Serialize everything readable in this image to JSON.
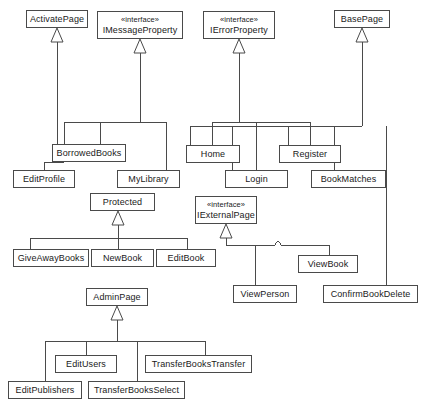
{
  "diagram": {
    "kind": "uml-class-diagram",
    "title": "",
    "background": "#ffffff",
    "line_color": "#4a4a4a",
    "text_color": "#1a1a1a",
    "width": 425,
    "height": 413
  },
  "nodes": [
    {
      "id": "ActivatePage",
      "name": "ActivatePage",
      "stereotype": "",
      "x": 26,
      "y": 10,
      "w": 62,
      "h": 18
    },
    {
      "id": "IMessageProperty",
      "name": "IMessageProperty",
      "stereotype": "«interface»",
      "x": 97,
      "y": 11,
      "w": 86,
      "h": 28
    },
    {
      "id": "IErrorProperty",
      "name": "IErrorProperty",
      "stereotype": "«interface»",
      "x": 203,
      "y": 11,
      "w": 72,
      "h": 28
    },
    {
      "id": "BasePage",
      "name": "BasePage",
      "stereotype": "",
      "x": 334,
      "y": 10,
      "w": 56,
      "h": 18
    },
    {
      "id": "BorrowedBooks",
      "name": "BorrowedBooks",
      "stereotype": "",
      "x": 52,
      "y": 144,
      "w": 74,
      "h": 18
    },
    {
      "id": "Home",
      "name": "Home",
      "stereotype": "",
      "x": 186,
      "y": 145,
      "w": 54,
      "h": 18
    },
    {
      "id": "Register",
      "name": "Register",
      "stereotype": "",
      "x": 279,
      "y": 145,
      "w": 62,
      "h": 18
    },
    {
      "id": "EditProfile",
      "name": "EditProfile",
      "stereotype": "",
      "x": 13,
      "y": 170,
      "w": 62,
      "h": 18
    },
    {
      "id": "MyLibrary",
      "name": "MyLibrary",
      "stereotype": "",
      "x": 117,
      "y": 170,
      "w": 63,
      "h": 18
    },
    {
      "id": "Login",
      "name": "Login",
      "stereotype": "",
      "x": 225,
      "y": 170,
      "w": 63,
      "h": 18
    },
    {
      "id": "BookMatches",
      "name": "BookMatches",
      "stereotype": "",
      "x": 311,
      "y": 170,
      "w": 75,
      "h": 18
    },
    {
      "id": "Protected",
      "name": "Protected",
      "stereotype": "",
      "x": 90,
      "y": 193,
      "w": 65,
      "h": 18
    },
    {
      "id": "IExternalPage",
      "name": "IExternalPage",
      "stereotype": "«interface»",
      "x": 195,
      "y": 196,
      "w": 62,
      "h": 28
    },
    {
      "id": "GiveAwayBooks",
      "name": "GiveAwayBooks",
      "stereotype": "",
      "x": 13,
      "y": 249,
      "w": 76,
      "h": 18
    },
    {
      "id": "NewBook",
      "name": "NewBook",
      "stereotype": "",
      "x": 91,
      "y": 249,
      "w": 63,
      "h": 18
    },
    {
      "id": "EditBook",
      "name": "EditBook",
      "stereotype": "",
      "x": 156,
      "y": 249,
      "w": 60,
      "h": 18
    },
    {
      "id": "ViewBook",
      "name": "ViewBook",
      "stereotype": "",
      "x": 298,
      "y": 255,
      "w": 60,
      "h": 18
    },
    {
      "id": "AdminPage",
      "name": "AdminPage",
      "stereotype": "",
      "x": 86,
      "y": 288,
      "w": 62,
      "h": 18
    },
    {
      "id": "ViewPerson",
      "name": "ViewPerson",
      "stereotype": "",
      "x": 233,
      "y": 285,
      "w": 64,
      "h": 18
    },
    {
      "id": "ConfirmBookDelete",
      "name": "ConfirmBookDelete",
      "stereotype": "",
      "x": 323,
      "y": 285,
      "w": 95,
      "h": 18
    },
    {
      "id": "EditUsers",
      "name": "EditUsers",
      "stereotype": "",
      "x": 55,
      "y": 355,
      "w": 62,
      "h": 18
    },
    {
      "id": "TransferBooksTransfer",
      "name": "TransferBooksTransfer",
      "stereotype": "",
      "x": 145,
      "y": 355,
      "w": 107,
      "h": 18
    },
    {
      "id": "EditPublishers",
      "name": "EditPublishers",
      "stereotype": "",
      "x": 8,
      "y": 381,
      "w": 74,
      "h": 18
    },
    {
      "id": "TransferBooksSelect",
      "name": "TransferBooksSelect",
      "stereotype": "",
      "x": 88,
      "y": 381,
      "w": 97,
      "h": 18
    }
  ],
  "generalizations": [
    {
      "from": "BorrowedBooks",
      "to": "ActivatePage",
      "label": ""
    },
    {
      "from": "EditProfile",
      "to": "IMessageProperty",
      "label": ""
    },
    {
      "from": "BorrowedBooks",
      "to": "IMessageProperty",
      "label": ""
    },
    {
      "from": "MyLibrary",
      "to": "IMessageProperty",
      "label": ""
    },
    {
      "from": "Home",
      "to": "IErrorProperty",
      "label": ""
    },
    {
      "from": "Login",
      "to": "IErrorProperty",
      "label": ""
    },
    {
      "from": "Register",
      "to": "IErrorProperty",
      "label": ""
    },
    {
      "from": "BookMatches",
      "to": "BasePage",
      "label": ""
    },
    {
      "from": "Home",
      "to": "BasePage",
      "label": ""
    },
    {
      "from": "Register",
      "to": "BasePage",
      "label": ""
    },
    {
      "from": "Login",
      "to": "BasePage",
      "label": ""
    },
    {
      "from": "ConfirmBookDelete",
      "to": "BasePage",
      "label": ""
    },
    {
      "from": "GiveAwayBooks",
      "to": "Protected",
      "label": ""
    },
    {
      "from": "NewBook",
      "to": "Protected",
      "label": ""
    },
    {
      "from": "EditBook",
      "to": "Protected",
      "label": ""
    },
    {
      "from": "ViewPerson",
      "to": "IExternalPage",
      "label": ""
    },
    {
      "from": "ViewBook",
      "to": "IExternalPage",
      "label": ""
    },
    {
      "from": "EditUsers",
      "to": "AdminPage",
      "label": ""
    },
    {
      "from": "EditPublishers",
      "to": "AdminPage",
      "label": ""
    },
    {
      "from": "TransferBooksSelect",
      "to": "AdminPage",
      "label": ""
    },
    {
      "from": "TransferBooksTransfer",
      "to": "AdminPage",
      "label": ""
    }
  ]
}
